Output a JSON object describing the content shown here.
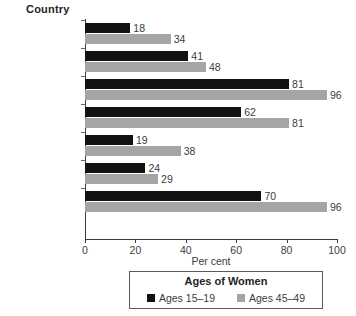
{
  "chart_data": {
    "type": "bar",
    "orientation": "horizontal",
    "title": "",
    "xlabel": "Per cent",
    "ylabel": "Country",
    "xlim": [
      0,
      100
    ],
    "xticks": [
      0,
      20,
      40,
      60,
      80,
      100
    ],
    "grid": false,
    "legend_position": "bottom",
    "legend_title": "Ages of Women",
    "categories": [
      "Central African Republic",
      "Chad",
      "Egypt",
      "Ethiopia",
      "Nigeria",
      "Senegal",
      "Sierra Leone"
    ],
    "series": [
      {
        "name": "Ages 15–19",
        "color": "#121212",
        "values": [
          18,
          41,
          81,
          62,
          19,
          24,
          70
        ]
      },
      {
        "name": "Ages 45–49",
        "color": "#a5a5a5",
        "values": [
          34,
          48,
          96,
          81,
          38,
          29,
          96
        ]
      }
    ]
  },
  "colors": {
    "series_black": "#121212",
    "series_gray": "#a5a5a5",
    "axis": "#3c3c3c",
    "background": "#ffffff"
  }
}
